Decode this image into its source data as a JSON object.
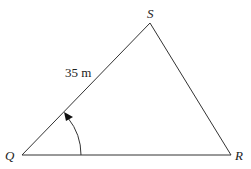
{
  "diagram": {
    "type": "triangle",
    "vertices": [
      {
        "name": "Q",
        "label": "Q"
      },
      {
        "name": "S",
        "label": "S"
      },
      {
        "name": "R",
        "label": "R"
      }
    ],
    "side_labels": {
      "QS": "35 m"
    },
    "angle_marker": {
      "at": "Q",
      "from": "QR",
      "to": "QS",
      "style": "arc-with-arrow"
    },
    "colors": {
      "line": "#333333",
      "background": "#ffffff"
    }
  }
}
